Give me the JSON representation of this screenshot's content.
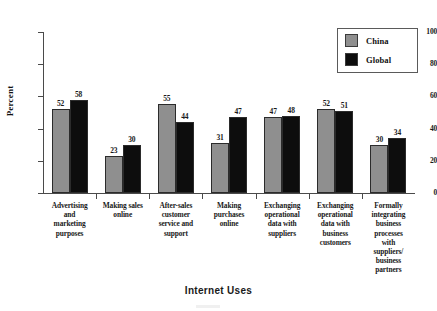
{
  "chart_data": {
    "type": "bar",
    "title": "",
    "xlabel": "Internet Uses",
    "ylabel": "Percent",
    "ylim": [
      0,
      100
    ],
    "yticks": [
      0,
      20,
      40,
      60,
      80,
      100
    ],
    "grid": false,
    "legend_position": "top-right",
    "categories": [
      "Advertising and marketing purposes",
      "Making sales online",
      "After-sales customer service and support",
      "Making purchases online",
      "Exchanging operational data with suppliers",
      "Exchanging operational data with business customers",
      "Formally integrating business processes with suppliers/ business partners"
    ],
    "category_lines": [
      [
        "Advertising",
        "and",
        "marketing",
        "purposes"
      ],
      [
        "Making sales",
        "online"
      ],
      [
        "After-sales",
        "customer",
        "service and",
        "support"
      ],
      [
        "Making",
        "purchases",
        "online"
      ],
      [
        "Exchanging",
        "operational",
        "data with",
        "suppliers"
      ],
      [
        "Exchanging",
        "operational",
        "data with",
        "business",
        "customers"
      ],
      [
        "Formally",
        "integrating",
        "business",
        "processes",
        "with",
        "suppliers/",
        "business",
        "partners"
      ]
    ],
    "series": [
      {
        "name": "China",
        "color": "#8f8f8f",
        "values": [
          52,
          23,
          55,
          31,
          47,
          52,
          30
        ]
      },
      {
        "name": "Global",
        "color": "#0d0d0d",
        "values": [
          58,
          30,
          44,
          47,
          48,
          51,
          34
        ]
      }
    ]
  },
  "legend": {
    "items": [
      {
        "label": "China",
        "swatch": "china"
      },
      {
        "label": "Global",
        "swatch": "global"
      }
    ]
  }
}
